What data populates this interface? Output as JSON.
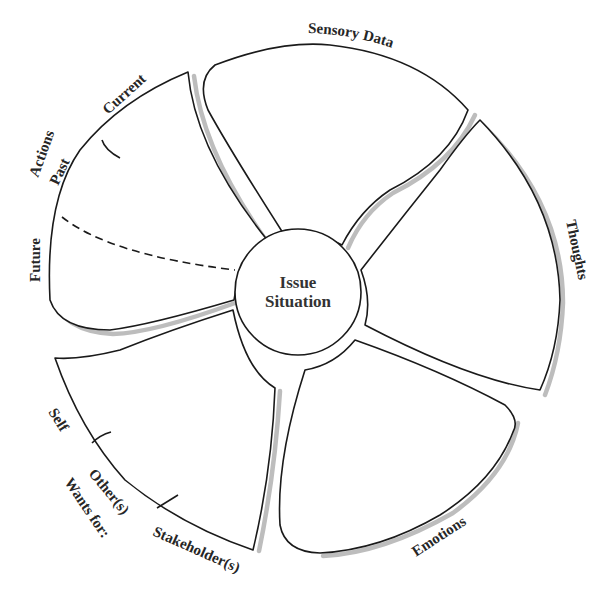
{
  "diagram": {
    "type": "petal-diagram",
    "center": {
      "line1": "Issue",
      "line2": "Situation"
    },
    "petals": [
      {
        "id": "sensory-data",
        "label": "Sensory Data"
      },
      {
        "id": "thoughts",
        "label": "Thoughts"
      },
      {
        "id": "emotions",
        "label": "Emotions"
      },
      {
        "id": "wants-for",
        "label": "Wants for:",
        "segments": [
          "Self",
          "Other(s)",
          "Stakeholder(s)"
        ]
      },
      {
        "id": "actions",
        "label": "Actions",
        "segments": [
          "Current",
          "Past",
          "Future"
        ]
      }
    ],
    "colors": {
      "stroke": "#1a1a1a",
      "shadow": "#bdbdbd",
      "text": "#262626",
      "background": "#ffffff"
    }
  }
}
